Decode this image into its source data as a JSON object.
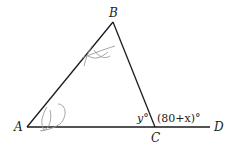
{
  "diagram": {
    "type": "triangle-exterior-angle",
    "points": {
      "A": {
        "label": "A",
        "x": 27,
        "y": 127
      },
      "B": {
        "label": "B",
        "x": 113,
        "y": 22
      },
      "C": {
        "label": "C",
        "x": 155,
        "y": 127
      },
      "D": {
        "label": "D",
        "x": 210,
        "y": 127
      }
    },
    "angles": {
      "interior_C": "y°",
      "exterior_C": "(80+x)°"
    },
    "segments": [
      "AB",
      "BC",
      "AD"
    ],
    "annotations": [
      "pencil scribble near side AB",
      "pencil scribble near vertex A"
    ],
    "colors": {
      "line": "#1a1a1a",
      "scribble": "#9a9a9a"
    }
  }
}
